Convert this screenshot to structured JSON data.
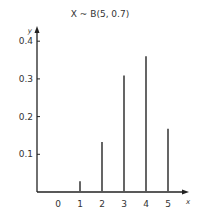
{
  "chart_data": {
    "type": "bar",
    "title": "X ~ B(5, 0.7)",
    "xlabel": "x",
    "ylabel": "y",
    "categories": [
      "0",
      "1",
      "2",
      "3",
      "4",
      "5"
    ],
    "x": [
      0,
      1,
      2,
      3,
      4,
      5
    ],
    "values": [
      0.0024,
      0.0284,
      0.1323,
      0.3087,
      0.3602,
      0.1681
    ],
    "yticks": [
      0.1,
      0.2,
      0.3,
      0.4
    ],
    "ytick_labels": [
      "0.1",
      "0.2",
      "0.3",
      "0.4"
    ],
    "ylim": [
      0,
      0.4
    ],
    "grid": false,
    "legend": "none",
    "bar_color": "#555555"
  }
}
